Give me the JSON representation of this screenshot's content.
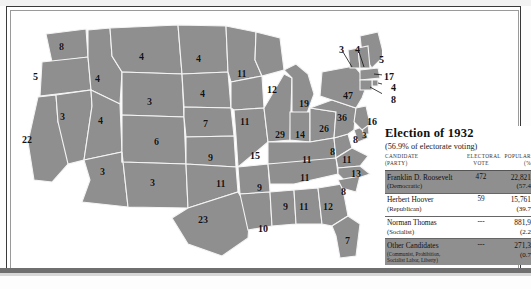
{
  "legend": {
    "title": "Election of 1932",
    "subtitle": "(56.9% of electorate voting)",
    "headers": {
      "candidate": "CANDIDATE",
      "candidate_sub": "(PARTY)",
      "electoral": "ELECTORAL",
      "electoral_sub": "VOTE",
      "popular": "POPULAR",
      "popular_sub": "(%"
    },
    "rows": [
      {
        "candidate": "Franklin D. Roosevelt",
        "party": "(Democratic)",
        "electoral": "472",
        "popular": "22,821",
        "percent": "(57.4"
      },
      {
        "candidate": "Herbert Hoover",
        "party": "(Republican)",
        "electoral": "59",
        "popular": "15,761",
        "percent": "(39.7"
      },
      {
        "candidate": "Norman Thomas",
        "party": "(Socialist)",
        "electoral": "---",
        "popular": "881,9",
        "percent": "(2.2"
      },
      {
        "candidate": "Other Candidates",
        "party": "(Communist, Prohibition,",
        "party2": "Socialist Labor, Liberty)",
        "electoral": "---",
        "popular": "271,3",
        "percent": "(0.7"
      }
    ]
  },
  "map": {
    "states": [
      {
        "code": "WA",
        "votes": "8",
        "x": 47,
        "y": 30,
        "size": "m"
      },
      {
        "code": "OR",
        "votes": "5",
        "x": 21,
        "y": 60,
        "size": "m"
      },
      {
        "code": "CA",
        "votes": "22",
        "x": 10,
        "y": 123,
        "size": "m"
      },
      {
        "code": "ID",
        "votes": "4",
        "x": 83,
        "y": 62,
        "size": "m"
      },
      {
        "code": "NV",
        "votes": "3",
        "x": 48,
        "y": 100,
        "size": "m"
      },
      {
        "code": "UT",
        "votes": "4",
        "x": 86,
        "y": 104,
        "size": "m"
      },
      {
        "code": "AZ",
        "votes": "3",
        "x": 88,
        "y": 155,
        "size": "m"
      },
      {
        "code": "MT",
        "votes": "4",
        "x": 127,
        "y": 40,
        "size": "m"
      },
      {
        "code": "WY",
        "votes": "3",
        "x": 135,
        "y": 85,
        "size": "m"
      },
      {
        "code": "CO",
        "votes": "6",
        "x": 142,
        "y": 125,
        "size": "m"
      },
      {
        "code": "NM",
        "votes": "3",
        "x": 138,
        "y": 166,
        "size": "m"
      },
      {
        "code": "ND",
        "votes": "4",
        "x": 184,
        "y": 42,
        "size": "m"
      },
      {
        "code": "SD",
        "votes": "4",
        "x": 188,
        "y": 77,
        "size": "m"
      },
      {
        "code": "NE",
        "votes": "7",
        "x": 191,
        "y": 107,
        "size": "m"
      },
      {
        "code": "KS",
        "votes": "9",
        "x": 196,
        "y": 141,
        "size": "m"
      },
      {
        "code": "OK",
        "votes": "11",
        "x": 204,
        "y": 167,
        "size": "m"
      },
      {
        "code": "TX",
        "votes": "23",
        "x": 186,
        "y": 203,
        "size": "m"
      },
      {
        "code": "MN",
        "votes": "11",
        "x": 225,
        "y": 57,
        "size": "m"
      },
      {
        "code": "IA",
        "votes": "11",
        "x": 228,
        "y": 105,
        "size": "m"
      },
      {
        "code": "MO",
        "votes": "15",
        "x": 238,
        "y": 139,
        "size": "m"
      },
      {
        "code": "AR",
        "votes": "9",
        "x": 245,
        "y": 171,
        "size": "m"
      },
      {
        "code": "LA",
        "votes": "10",
        "x": 246,
        "y": 212,
        "size": "m"
      },
      {
        "code": "WI",
        "votes": "12",
        "x": 255,
        "y": 73,
        "size": "m"
      },
      {
        "code": "IL",
        "votes": "29",
        "x": 263,
        "y": 118,
        "size": "m"
      },
      {
        "code": "MS",
        "votes": "9",
        "x": 271,
        "y": 190,
        "size": "m"
      },
      {
        "code": "MI",
        "votes": "19",
        "x": 287,
        "y": 87,
        "size": "m"
      },
      {
        "code": "IN",
        "votes": "14",
        "x": 283,
        "y": 118,
        "size": "m"
      },
      {
        "code": "KY",
        "votes": "11",
        "x": 290,
        "y": 143,
        "size": "m"
      },
      {
        "code": "TN",
        "votes": "11",
        "x": 288,
        "y": 161,
        "size": "m"
      },
      {
        "code": "AL",
        "votes": "11",
        "x": 287,
        "y": 190,
        "size": "m"
      },
      {
        "code": "GA",
        "votes": "12",
        "x": 311,
        "y": 190,
        "size": "m"
      },
      {
        "code": "FL",
        "votes": "7",
        "x": 333,
        "y": 224,
        "size": "m"
      },
      {
        "code": "OH",
        "votes": "26",
        "x": 307,
        "y": 112,
        "size": "m"
      },
      {
        "code": "WV",
        "votes": "8",
        "x": 318,
        "y": 135,
        "size": "m"
      },
      {
        "code": "VA",
        "votes": "11",
        "x": 330,
        "y": 143,
        "size": "m"
      },
      {
        "code": "NC",
        "votes": "13",
        "x": 339,
        "y": 157,
        "size": "m"
      },
      {
        "code": "SC",
        "votes": "8",
        "x": 329,
        "y": 175,
        "size": "m"
      },
      {
        "code": "PA",
        "votes": "36",
        "x": 325,
        "y": 101,
        "size": "m"
      },
      {
        "code": "NY",
        "votes": "47",
        "x": 331,
        "y": 79,
        "size": "m"
      },
      {
        "code": "MD",
        "votes": "8",
        "x": 341,
        "y": 123,
        "size": "m"
      },
      {
        "code": "DE",
        "votes": "3",
        "x": 350,
        "y": 119,
        "size": "s"
      },
      {
        "code": "NJ",
        "votes": "16",
        "x": 355,
        "y": 105,
        "size": "m"
      },
      {
        "code": "ME",
        "votes": "5",
        "x": 367,
        "y": 43,
        "size": "m"
      },
      {
        "code": "VT",
        "votes": "3",
        "x": 327,
        "y": 33,
        "size": "m"
      },
      {
        "code": "NH",
        "votes": "4",
        "x": 343,
        "y": 33,
        "size": "m"
      },
      {
        "code": "MA",
        "votes": "17",
        "x": 372,
        "y": 60,
        "size": "m"
      },
      {
        "code": "RI",
        "votes": "4",
        "x": 379,
        "y": 71,
        "size": "m"
      },
      {
        "code": "CT",
        "votes": "8",
        "x": 379,
        "y": 83,
        "size": "m"
      }
    ]
  }
}
